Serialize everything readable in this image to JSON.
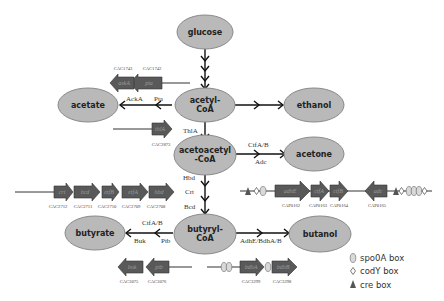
{
  "metabolites": {
    "glucose": "glucose",
    "acetyl_coa": [
      "acetyl-",
      "CoA"
    ],
    "acetate": "acetate",
    "ethanol": "ethanol",
    "acetoacetyl_coa": [
      "acetoacetyl",
      "-CoA"
    ],
    "acetone": "acetone",
    "butyryl_coa": [
      "butyryl-",
      "CoA"
    ],
    "butyrate": "butyrate",
    "butanol": "butanol"
  },
  "enzymes": {
    "acka": "AckA",
    "pta": "Pta",
    "thla": "ThlA",
    "ctfab_top": "CtfA/B",
    "adc": "Adc",
    "hbd": "Hbd",
    "crt": "Crt",
    "bcd": "Bcd",
    "ctfab_bottom": "CtfA/B",
    "buk": "Buk",
    "ptb": "Ptb",
    "adhe_bdha_b": "AdhE/BdhA/B"
  },
  "operons": {
    "ack_pta": {
      "genes": [
        {
          "name": "askA",
          "locus": "CAC1743"
        },
        {
          "name": "pta",
          "locus": "CAC1742"
        }
      ]
    },
    "thl": {
      "genes": [
        {
          "name": "thlA",
          "locus": "CAC2873"
        }
      ]
    },
    "bcs": {
      "genes": [
        {
          "name": "crt",
          "locus": "CAC2712"
        },
        {
          "name": "bcd",
          "locus": "CAC2711"
        },
        {
          "name": "etfB",
          "locus": "CAC2710"
        },
        {
          "name": "etfA",
          "locus": "CAC2709"
        },
        {
          "name": "hbd",
          "locus": "CAC2708"
        }
      ]
    },
    "sol": {
      "genes": [
        {
          "name": "adhE",
          "locus": "CAP0162"
        },
        {
          "name": "ctfA",
          "locus": "CAP0163"
        },
        {
          "name": "ctfB",
          "locus": "CAP0164"
        },
        {
          "name": "adc",
          "locus": "CAP0165"
        }
      ]
    },
    "ptb_buk": {
      "genes": [
        {
          "name": "buk",
          "locus": "CAC3075"
        },
        {
          "name": "ptb",
          "locus": "CAC3076"
        }
      ]
    },
    "bdh": {
      "genes": [
        {
          "name": "bdhA",
          "locus": "CAC3299"
        },
        {
          "name": "bdhB",
          "locus": "CAC3298"
        }
      ]
    }
  },
  "legend": {
    "items": [
      {
        "symbol": "spo0a-box",
        "label": "spo0A box"
      },
      {
        "symbol": "cody-box",
        "label": "codY box"
      },
      {
        "symbol": "cre-box",
        "label": "cre box"
      }
    ]
  },
  "colors": {
    "node_fill": "#b9b9b9",
    "gene_fill": "#595959",
    "arrow": "#111111"
  }
}
